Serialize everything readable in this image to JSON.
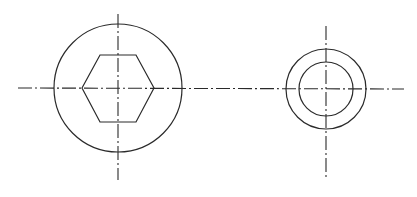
{
  "diagram": {
    "type": "technical-drawing",
    "background": "#ffffff",
    "stroke_color": "#2a2a2a",
    "shared_horizontal_centerline": {
      "x1": 18,
      "y1": 88,
      "x2": 404,
      "y2": 89
    },
    "views": [
      {
        "name": "hex-socket-head-view",
        "center": [
          118,
          88
        ],
        "outer_circle_radius": 64,
        "hexagon": {
          "points": "82,88 100,55 136,55 154,88 136,122 100,122"
        },
        "vertical_centerline": {
          "x": 118,
          "y1": 14,
          "y2": 180
        }
      },
      {
        "name": "concentric-circles-view",
        "center": [
          326,
          89
        ],
        "outer_circle_radius": 40,
        "inner_circle_radius": 27,
        "vertical_centerline": {
          "x": 326,
          "y1": 26,
          "y2": 180
        }
      }
    ]
  }
}
